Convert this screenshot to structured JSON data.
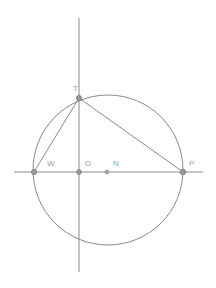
{
  "figure": {
    "background_color": "#ffffff",
    "stroke_color": "#8a8a8a",
    "label_color": "#9d9d9d",
    "point_fill_color": "#9a9a9a"
  },
  "chart_data": {
    "type": "diagram",
    "subtype": "euclidean-geometry",
    "title": "",
    "xlabel": "",
    "ylabel": "",
    "coordinate_space": {
      "width": 216,
      "height": 288,
      "origin_label": "O",
      "origin_x": 79,
      "origin_y": 172
    },
    "axes": [
      {
        "name": "horizontal-axis",
        "orientation": "horizontal",
        "x1": 14,
        "y1": 172,
        "x2": 203,
        "y2": 172
      },
      {
        "name": "vertical-axis",
        "orientation": "vertical",
        "x1": 79,
        "y1": 18,
        "x2": 79,
        "y2": 272
      }
    ],
    "circles": [
      {
        "name": "main-circle",
        "cx": 108,
        "cy": 170,
        "r": 75,
        "center_point": "N",
        "passes_through": [
          "W",
          "T",
          "P"
        ]
      }
    ],
    "points": [
      {
        "id": "W",
        "label": "W",
        "x": 34,
        "y": 172,
        "label_x": 47,
        "label_y": 166,
        "radius": 2.6,
        "on_circle": true
      },
      {
        "id": "O",
        "label": "O",
        "x": 79,
        "y": 172,
        "label_x": 85,
        "label_y": 166,
        "radius": 2.4,
        "on_circle": false
      },
      {
        "id": "N",
        "label": "N",
        "x": 107,
        "y": 172,
        "label_x": 113,
        "label_y": 166,
        "radius": 2.0,
        "on_circle": false
      },
      {
        "id": "P",
        "label": "P",
        "x": 183,
        "y": 172,
        "label_x": 189,
        "label_y": 166,
        "radius": 2.8,
        "on_circle": true
      },
      {
        "id": "T",
        "label": "T",
        "x": 79,
        "y": 98,
        "label_x": 73,
        "label_y": 91,
        "radius": 2.6,
        "on_circle": true
      }
    ],
    "segments": [
      {
        "name": "chord-WT",
        "from": "W",
        "to": "T",
        "x1": 34,
        "y1": 172,
        "x2": 79,
        "y2": 98
      },
      {
        "name": "chord-TP",
        "from": "T",
        "to": "P",
        "x1": 79,
        "y1": 98,
        "x2": 183,
        "y2": 172
      }
    ],
    "labels": [
      "W",
      "O",
      "N",
      "P",
      "T"
    ],
    "legend": [],
    "annotations": [],
    "grid": false
  }
}
